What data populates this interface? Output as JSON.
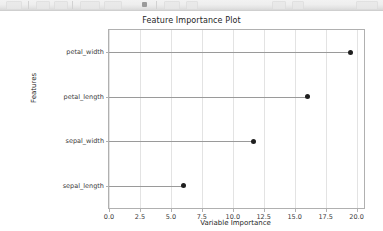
{
  "toolbar": {
    "visible": true,
    "description": "partially-cropped-application-toolbar"
  },
  "figure": {
    "background_color": "#ffffff",
    "axes_edge_color": "#b0b0b0",
    "grid_color": "#e3e3e3"
  },
  "chart_data": {
    "type": "scatter",
    "title": "Feature Importance Plot",
    "xlabel": "Variable Importance",
    "ylabel": "Features",
    "orientation": "horizontal",
    "marker": "filled-circle",
    "marker_color": "#1f1f1f",
    "stem_color": "#9a9a9a",
    "grid": true,
    "grid_axis": "both",
    "legend": null,
    "xlim": [
      0.0,
      20.6
    ],
    "xticks": [
      0.0,
      2.5,
      5.0,
      7.5,
      10.0,
      12.5,
      15.0,
      17.5,
      20.0
    ],
    "xtick_labels": [
      "0.0",
      "2.5",
      "5.0",
      "7.5",
      "10.0",
      "12.5",
      "15.0",
      "17.5",
      "20.0"
    ],
    "categories": [
      "sepal_length",
      "sepal_width",
      "petal_length",
      "petal_width"
    ],
    "values": [
      6.0,
      11.7,
      16.0,
      19.5
    ],
    "points": [
      {
        "feature": "petal_width",
        "importance": 19.5
      },
      {
        "feature": "petal_length",
        "importance": 16.0
      },
      {
        "feature": "sepal_width",
        "importance": 11.7
      },
      {
        "feature": "sepal_length",
        "importance": 6.0
      }
    ]
  }
}
